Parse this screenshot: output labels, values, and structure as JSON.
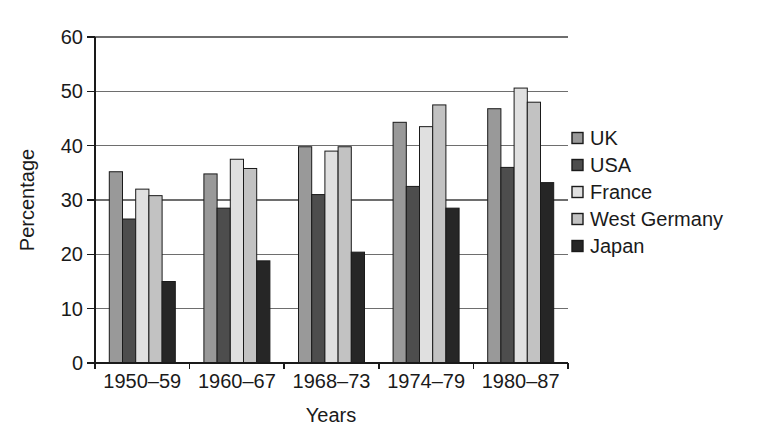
{
  "chart_data": {
    "type": "bar",
    "title": "",
    "xlabel": "Years",
    "ylabel": "Percentage",
    "ylim": [
      0,
      60
    ],
    "yticks": [
      0,
      10,
      20,
      30,
      40,
      50,
      60
    ],
    "grid": "horizontal",
    "legend_position": "right",
    "categories": [
      "1950–59",
      "1960–67",
      "1968–73",
      "1974–79",
      "1980–87"
    ],
    "series": [
      {
        "name": "UK",
        "color": "#999999",
        "values": [
          35.2,
          34.8,
          39.8,
          44.3,
          46.8
        ]
      },
      {
        "name": "USA",
        "color": "#4d4d4d",
        "values": [
          26.5,
          28.5,
          31.0,
          32.5,
          36.0
        ]
      },
      {
        "name": "France",
        "color": "#e0e0e0",
        "values": [
          32.0,
          37.5,
          39.0,
          43.5,
          50.6
        ]
      },
      {
        "name": "West Germany",
        "color": "#c2c2c2",
        "values": [
          30.8,
          35.8,
          39.8,
          47.5,
          48.0
        ]
      },
      {
        "name": "Japan",
        "color": "#262626",
        "values": [
          15.0,
          18.8,
          20.4,
          28.5,
          33.2
        ]
      }
    ],
    "colors": {
      "bar_outline": "#1a1a1a",
      "gridline": "#6e6e6e",
      "axis": "#1a1a1a",
      "text": "#1a1a1a",
      "background": "#ffffff"
    }
  }
}
